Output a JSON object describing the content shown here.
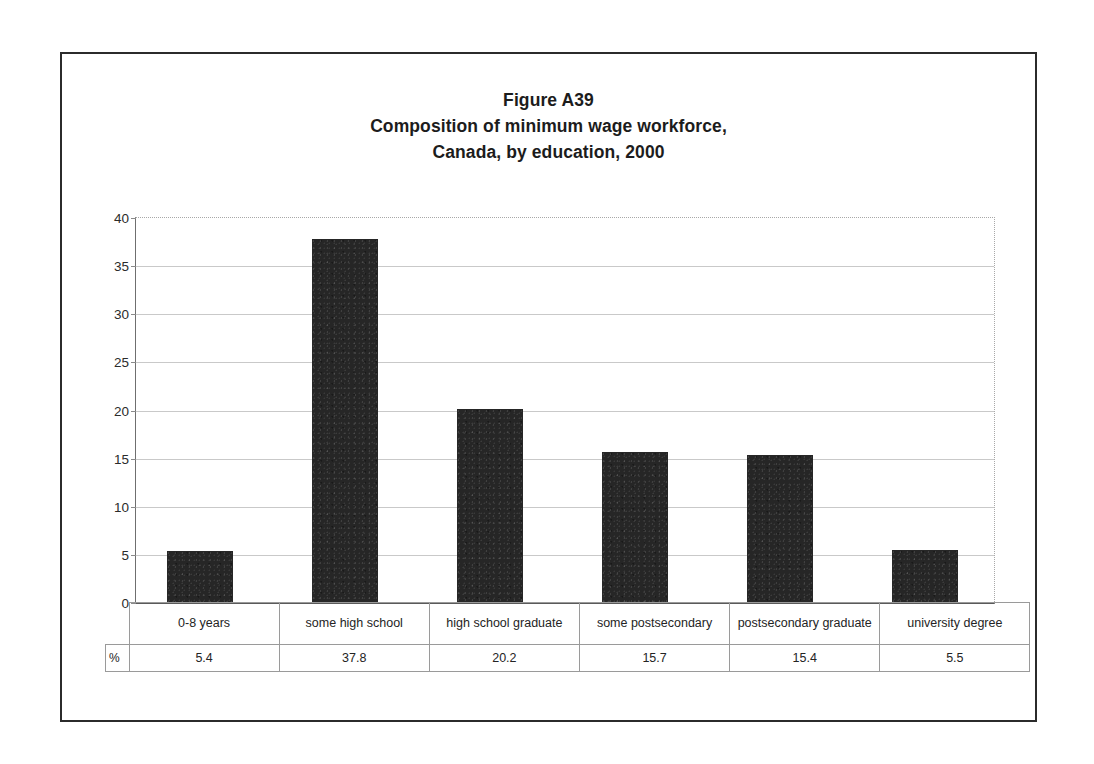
{
  "title": {
    "line1": "Figure A39",
    "line2": "Composition of minimum wage workforce,",
    "line3": "Canada, by education, 2000"
  },
  "table": {
    "unit_label": "%",
    "categories": [
      "0-8 years",
      "some high school",
      "high school graduate",
      "some postsecondary",
      "postsecondary graduate",
      "university degree"
    ],
    "values": [
      "5.4",
      "37.8",
      "20.2",
      "15.7",
      "15.4",
      "5.5"
    ]
  },
  "axis": {
    "ticks": [
      "40",
      "35",
      "30",
      "25",
      "20",
      "15",
      "10",
      "5",
      "0"
    ]
  },
  "colors": {
    "bar": "#262626",
    "gridline": "#c9c9c9",
    "frame": "#2b2b2b",
    "text": "#1c1c1c"
  },
  "chart_data": {
    "type": "bar",
    "xlabel": "",
    "ylabel": "%",
    "ylim": [
      0,
      40
    ],
    "ytick_step": 5,
    "grid": true,
    "legend": "none",
    "categories": [
      "0-8 years",
      "some high school",
      "high school graduate",
      "some postsecondary",
      "postsecondary graduate",
      "university degree"
    ],
    "values": [
      5.4,
      37.8,
      20.2,
      15.7,
      15.4,
      5.5
    ]
  }
}
